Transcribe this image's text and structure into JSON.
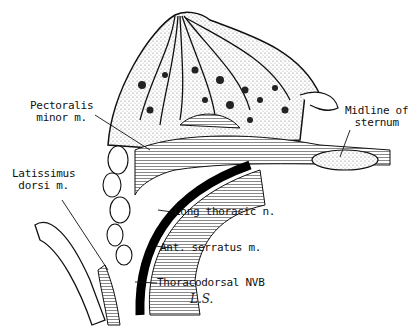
{
  "figure": {
    "colors": {
      "ink": "#111111",
      "paper": "#ffffff",
      "stipple": "#9a9a9a"
    },
    "labels": {
      "pectoralis_minor": [
        "Pectoralis",
        "minor m."
      ],
      "latissimus_dorsi": [
        "Latissimus",
        "dorsi m."
      ],
      "midline_sternum": [
        "Midline of",
        "sternum"
      ],
      "long_thoracic": "Long thoracic n.",
      "ant_serratus": "Ant. serratus m.",
      "thoracodorsal": "Thoracodorsal NVB"
    },
    "signature": "L.S."
  }
}
